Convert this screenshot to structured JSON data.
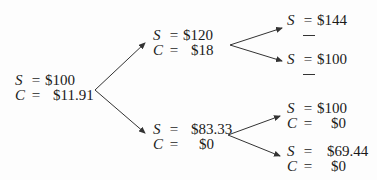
{
  "tree": {
    "root": {
      "s_label": "S",
      "c_label": "C",
      "eq": "=",
      "s": "$100",
      "c": "$11.91"
    },
    "up": {
      "s_label": "S",
      "c_label": "C",
      "eq": "=",
      "s": "$120",
      "c": "$18"
    },
    "down": {
      "s_label": "S",
      "c_label": "C",
      "eq": "=",
      "s": "$83.33",
      "c": "$0"
    },
    "upup": {
      "s_label": "S",
      "eq": "=",
      "s": "$144",
      "c": "—"
    },
    "updown": {
      "s_label": "S",
      "eq": "=",
      "s": "$100",
      "c": "—"
    },
    "downup": {
      "s_label": "S",
      "c_label": "C",
      "eq": "=",
      "s": "$100",
      "c": "$0"
    },
    "downdown": {
      "s_label": "S",
      "c_label": "C",
      "eq": "=",
      "s": "$69.44",
      "c": "$0"
    }
  }
}
